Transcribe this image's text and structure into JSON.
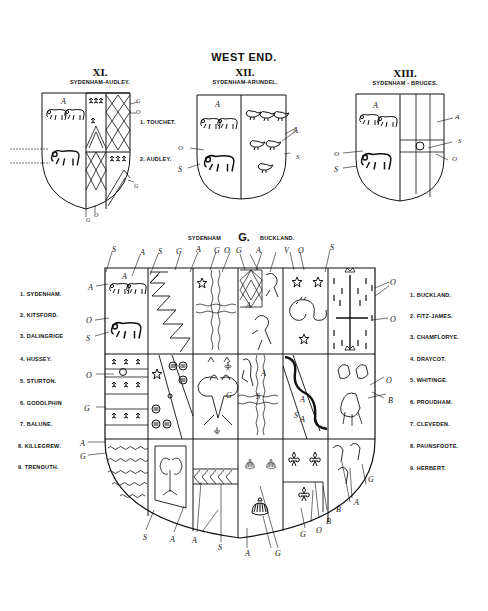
{
  "heading": "WEST END.",
  "small_shields": [
    {
      "numeral": "XI.",
      "caption": "SYDENHAM-AUDLEY.",
      "labels": [
        "1. TOUCHET.",
        "2. AUDLEY."
      ]
    },
    {
      "numeral": "XII.",
      "caption": "SYDENHAM-ARUNDEL."
    },
    {
      "numeral": "XIII.",
      "caption": "SYDENHAM - BRUGES."
    }
  ],
  "main_shield": {
    "caption_left": "SYDENHAM",
    "caption_center": "G.",
    "caption_right": "BUCKLAND.",
    "left_list": [
      "1. SYDENHAM.",
      "2. KITSFORD.",
      "3. DALINGRIGE",
      "4. HUSSEY.",
      "5. STURTON.",
      "6. GODOLPHIN",
      "7. BALUNE.",
      "8. KILLEGREW.",
      "9. TRENOUTH."
    ],
    "right_list": [
      "1. BUCKLAND.",
      "2. FITZ-JAMES.",
      "3. CHAMFLORYE.",
      "4. DRAYCOT.",
      "5. WHITINGE.",
      "6. PROUDHAM.",
      "7. CLEVEDEN.",
      "8. PAUNSFOOTE.",
      "9. HERBERT."
    ]
  },
  "tinctures": {
    "A": "A",
    "S": "S",
    "O": "O",
    "G": "G",
    "B": "B",
    "V": "V"
  },
  "colors": {
    "ink": "#111111",
    "paper": "#ffffff"
  }
}
